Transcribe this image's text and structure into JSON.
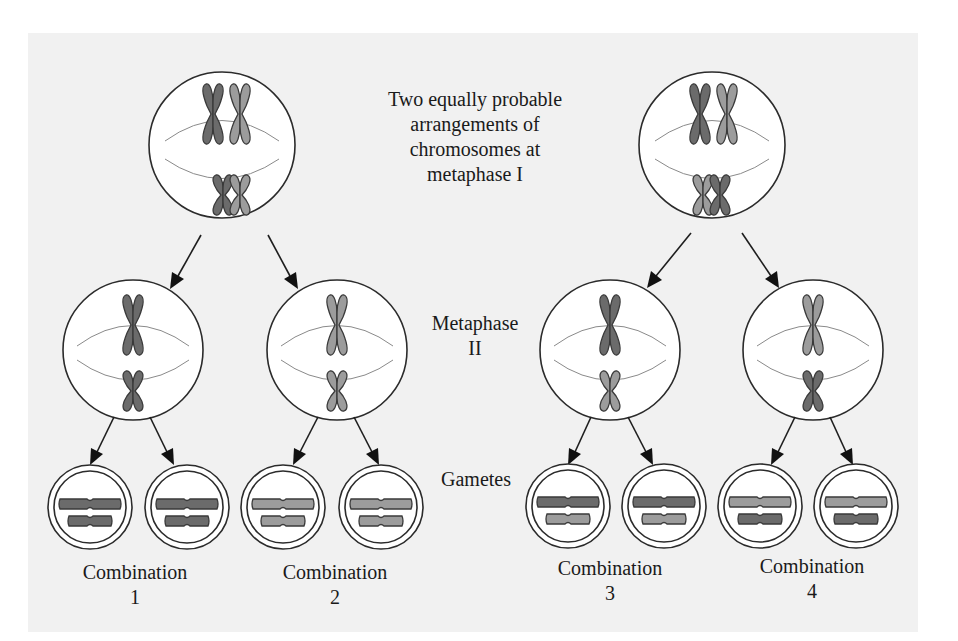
{
  "diagram": {
    "title_lines": [
      "Two equally probable",
      "arrangements of",
      "chromosomes at",
      "metaphase I"
    ],
    "stage_labels": {
      "metaphase_ii": [
        "Metaphase",
        "II"
      ],
      "gametes": "Gametes"
    },
    "combinations": [
      {
        "label": "Combination",
        "number": "1"
      },
      {
        "label": "Combination",
        "number": "2"
      },
      {
        "label": "Combination",
        "number": "3"
      },
      {
        "label": "Combination",
        "number": "4"
      }
    ],
    "colors": {
      "dark_chromosome": "#6b6b6b",
      "light_chromosome": "#9c9c9c",
      "panel_background": "#f1f1f1",
      "outline": "#2b2b2b"
    },
    "metaphase_i_cells": [
      {
        "name": "arrangement-a",
        "top_pair": [
          "dark",
          "light"
        ],
        "bottom_pair": [
          "dark",
          "light"
        ]
      },
      {
        "name": "arrangement-b",
        "top_pair": [
          "dark",
          "light"
        ],
        "bottom_pair": [
          "light",
          "dark"
        ]
      }
    ],
    "metaphase_ii_cells": [
      {
        "large": "dark",
        "small": "dark"
      },
      {
        "large": "light",
        "small": "light"
      },
      {
        "large": "dark",
        "small": "light"
      },
      {
        "large": "light",
        "small": "dark"
      }
    ],
    "gametes": [
      {
        "large": "dark",
        "small": "dark",
        "combination": "1"
      },
      {
        "large": "dark",
        "small": "dark",
        "combination": "1"
      },
      {
        "large": "light",
        "small": "light",
        "combination": "2"
      },
      {
        "large": "light",
        "small": "light",
        "combination": "2"
      },
      {
        "large": "dark",
        "small": "light",
        "combination": "3"
      },
      {
        "large": "dark",
        "small": "light",
        "combination": "3"
      },
      {
        "large": "light",
        "small": "dark",
        "combination": "4"
      },
      {
        "large": "light",
        "small": "dark",
        "combination": "4"
      }
    ]
  }
}
